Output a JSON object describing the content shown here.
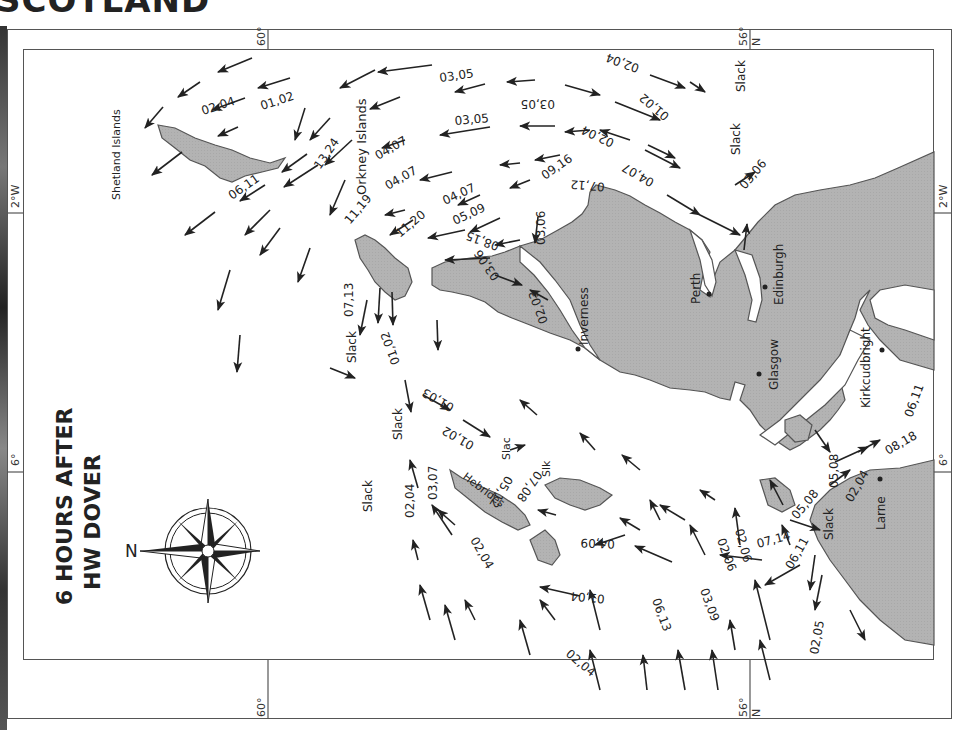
{
  "page_title_cropped": "SCOTLAND",
  "map": {
    "title_line1": "6 HOURS AFTER",
    "title_line2": "HW DOVER",
    "compass_label": "N",
    "orientation": "rotated 90° — north points left",
    "colors": {
      "land": "#b3b3b3",
      "land_stroke": "#555555",
      "sea": "#ffffff",
      "arrow": "#222222",
      "frame": "#555555"
    },
    "graticule": {
      "top": [
        {
          "label": "60°",
          "edge": "top"
        },
        {
          "label": "56°",
          "edge": "top"
        },
        {
          "label": "N",
          "edge": "top"
        }
      ],
      "bottom": [
        {
          "label": "60°",
          "edge": "bottom"
        },
        {
          "label": "56°",
          "edge": "bottom"
        },
        {
          "label": "N",
          "edge": "bottom"
        }
      ],
      "left": [
        {
          "label": "2°W"
        },
        {
          "label": "6°"
        }
      ],
      "right": [
        {
          "label": "2°W"
        },
        {
          "label": "6°"
        }
      ]
    },
    "places": [
      {
        "name": "Shetland Islands",
        "type": "island-group"
      },
      {
        "name": "Orkney Islands",
        "type": "island-group"
      },
      {
        "name": "Hebrides",
        "type": "island-group"
      },
      {
        "name": "Inverness",
        "type": "town"
      },
      {
        "name": "Perth",
        "type": "town"
      },
      {
        "name": "Edinburgh",
        "type": "town"
      },
      {
        "name": "Glasgow",
        "type": "town"
      },
      {
        "name": "Kirkcudbright",
        "type": "town"
      },
      {
        "name": "Larne",
        "type": "town"
      }
    ],
    "slack_labels": [
      "Slack",
      "Slack",
      "Slack",
      "Slack",
      "Slack",
      "Slack",
      "Slac",
      "Slk",
      "Slack"
    ],
    "rate_labels": [
      "02,04",
      "01,02",
      "06,11",
      "13,24",
      "03,05",
      "03,05",
      "03,05",
      "02,04",
      "02,04",
      "01,02",
      "04,07",
      "04,07",
      "04,07",
      "04,07",
      "09,16",
      "07,12",
      "03,06",
      "11,19",
      "11,20",
      "05,09",
      "08,15",
      "03,06",
      "03,06",
      "02,03",
      "07,13",
      "01,02",
      "01,03",
      "02,04",
      "03,07",
      "01,02",
      "05,12",
      "07,08",
      "02,04",
      "04,09",
      "01,04",
      "02,04",
      "06,13",
      "03,09",
      "02,06",
      "02,06",
      "07,14",
      "06,11",
      "05,08",
      "05,08",
      "02,04",
      "08,18",
      "06,11",
      "02,05"
    ]
  }
}
